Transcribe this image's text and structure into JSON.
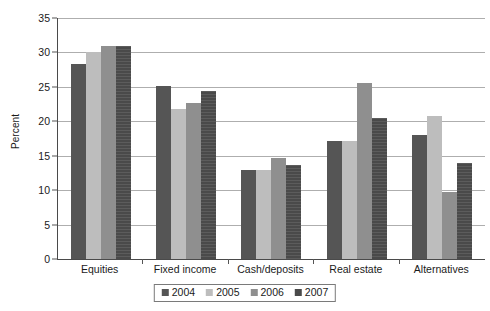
{
  "chart_data": {
    "type": "bar",
    "title": "",
    "subtitle": "",
    "xlabel": "",
    "ylabel": "Percent",
    "ylim": [
      0,
      35
    ],
    "ytick_step": 5,
    "yticks": [
      0,
      5,
      10,
      15,
      20,
      25,
      30,
      35
    ],
    "ytick_labels": [
      "0",
      "5",
      "10",
      "15",
      "20",
      "25",
      "30",
      "35"
    ],
    "grid": true,
    "grid_axis": "y",
    "legend_position": "bottom-center",
    "categories": [
      "Equities",
      "Fixed income",
      "Cash/deposits",
      "Real estate",
      "Alternatives"
    ],
    "series": [
      {
        "name": "2004",
        "color": "#555555",
        "values": [
          28.3,
          25.1,
          12.9,
          17.1,
          18.0
        ]
      },
      {
        "name": "2005",
        "color": "#bdbdbd",
        "values": [
          30.1,
          21.8,
          12.9,
          17.1,
          20.7
        ]
      },
      {
        "name": "2006",
        "color": "#8f8f8f",
        "values": [
          30.9,
          22.6,
          14.6,
          25.5,
          9.8
        ]
      },
      {
        "name": "2007",
        "color": "#4a4a4a",
        "values": [
          30.9,
          24.4,
          13.7,
          20.5,
          14.0
        ]
      }
    ],
    "annotations": []
  },
  "colors": {
    "axis": "#4a4a4a",
    "gridline": "#aeaeae",
    "text": "#1a1a1a",
    "background": "#ffffff",
    "series_2004": "#555555",
    "series_2005": "#bdbdbd",
    "series_2006": "#8f8f8f",
    "series_2007": "#4a4a4a"
  }
}
